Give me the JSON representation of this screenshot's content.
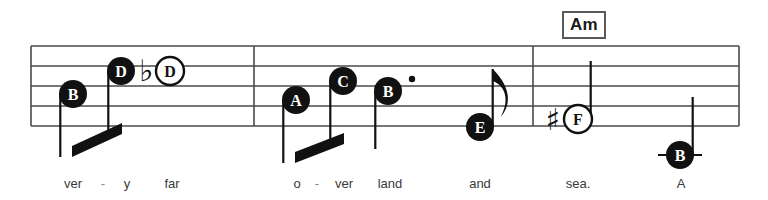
{
  "page": {
    "background_color": "#ffffff",
    "width": 768,
    "height": 200
  },
  "chord_symbols": [
    {
      "label": "Am",
      "x": 584,
      "y": 24
    }
  ],
  "staff": {
    "x_start": 31,
    "x_end": 739,
    "line_top_y": 46,
    "line_spacing": 20,
    "line_count": 5,
    "line_color": "#4a4a4a",
    "line_width": 1.4,
    "barlines": [
      254,
      533,
      739
    ]
  },
  "notes": [
    {
      "id": "n1",
      "letter": "B",
      "head": "filled",
      "cx": 73,
      "cy": 94,
      "stem": "down",
      "beam_group": 1,
      "accidental": null,
      "dotted": false,
      "ledger": false
    },
    {
      "id": "n2",
      "letter": "D",
      "head": "filled",
      "cx": 121,
      "cy": 71,
      "stem": "down",
      "beam_group": 1,
      "accidental": null,
      "dotted": false,
      "ledger": false
    },
    {
      "id": "n3",
      "letter": "D",
      "head": "open",
      "cx": 170,
      "cy": 71,
      "stem": "none",
      "beam_group": null,
      "accidental": "flat",
      "dotted": false,
      "ledger": false
    },
    {
      "id": "n4",
      "letter": "A",
      "head": "filled",
      "cx": 296,
      "cy": 100,
      "stem": "down",
      "beam_group": 2,
      "accidental": null,
      "dotted": false,
      "ledger": false
    },
    {
      "id": "n5",
      "letter": "C",
      "head": "filled",
      "cx": 343,
      "cy": 81,
      "stem": "down",
      "beam_group": 2,
      "accidental": null,
      "dotted": false,
      "ledger": false
    },
    {
      "id": "n6",
      "letter": "B",
      "head": "filled",
      "cx": 388,
      "cy": 91,
      "stem": "down",
      "beam_group": null,
      "accidental": null,
      "dotted": true,
      "ledger": false
    },
    {
      "id": "n7",
      "letter": "E",
      "head": "filled",
      "cx": 480,
      "cy": 127,
      "stem": "up-flag",
      "beam_group": null,
      "accidental": null,
      "dotted": false,
      "ledger": false
    },
    {
      "id": "n8",
      "letter": "F",
      "head": "open",
      "cx": 578,
      "cy": 119,
      "stem": "up",
      "beam_group": null,
      "accidental": "sharp",
      "dotted": false,
      "ledger": false
    },
    {
      "id": "n9",
      "letter": "B",
      "head": "filled",
      "cx": 680,
      "cy": 155,
      "stem": "up",
      "beam_group": null,
      "accidental": null,
      "dotted": false,
      "ledger": true
    }
  ],
  "accidentals": [
    {
      "symbol": "flat",
      "glyph": "♭",
      "x": 146,
      "y": 70
    },
    {
      "symbol": "sharp",
      "glyph": "♯",
      "x": 553,
      "y": 119
    }
  ],
  "lyrics": [
    {
      "text": "ver",
      "x": 73,
      "y": 186,
      "type": "syllable"
    },
    {
      "text": "-",
      "x": 103,
      "y": 186,
      "type": "hyphen"
    },
    {
      "text": "y",
      "x": 127,
      "y": 186,
      "type": "syllable"
    },
    {
      "text": "far",
      "x": 172,
      "y": 186,
      "type": "syllable"
    },
    {
      "text": "o",
      "x": 297,
      "y": 186,
      "type": "syllable"
    },
    {
      "text": "-",
      "x": 317,
      "y": 186,
      "type": "hyphen"
    },
    {
      "text": "ver",
      "x": 344,
      "y": 186,
      "type": "syllable"
    },
    {
      "text": "land",
      "x": 390,
      "y": 186,
      "type": "syllable"
    },
    {
      "text": "and",
      "x": 480,
      "y": 186,
      "type": "syllable"
    },
    {
      "text": "sea.",
      "x": 578,
      "y": 186,
      "type": "syllable"
    },
    {
      "text": "A",
      "x": 681,
      "y": 186,
      "type": "syllable"
    }
  ]
}
